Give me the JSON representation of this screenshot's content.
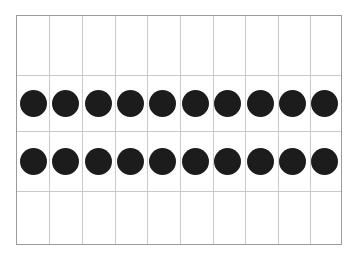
{
  "worksheet": {
    "title": "Counting grid with round counters",
    "background_color": "#ffffff"
  },
  "grid": {
    "frame_color": "#9b9b9b",
    "gridline_color": "#c9c9c9",
    "columns": 10,
    "rows": 5,
    "column_count_label": "10",
    "row_count_label": "5",
    "horizontal_gridlines": [
      59,
      115,
      175
    ],
    "vertical_gridline_spacing": "32.6"
  },
  "counters": {
    "color": "#1c1c1c",
    "shape": "circle",
    "diameter_px": 27,
    "total_label": "20",
    "rows": [
      {
        "row_label": "row-1",
        "count_label": "10",
        "dots": [
          {
            "index_label": "1"
          },
          {
            "index_label": "2"
          },
          {
            "index_label": "3"
          },
          {
            "index_label": "4"
          },
          {
            "index_label": "5"
          },
          {
            "index_label": "6"
          },
          {
            "index_label": "7"
          },
          {
            "index_label": "8"
          },
          {
            "index_label": "9"
          },
          {
            "index_label": "10"
          }
        ]
      },
      {
        "row_label": "row-2",
        "count_label": "10",
        "dots": [
          {
            "index_label": "11"
          },
          {
            "index_label": "12"
          },
          {
            "index_label": "13"
          },
          {
            "index_label": "14"
          },
          {
            "index_label": "15"
          },
          {
            "index_label": "16"
          },
          {
            "index_label": "17"
          },
          {
            "index_label": "18"
          },
          {
            "index_label": "19"
          },
          {
            "index_label": "20"
          }
        ]
      }
    ]
  }
}
